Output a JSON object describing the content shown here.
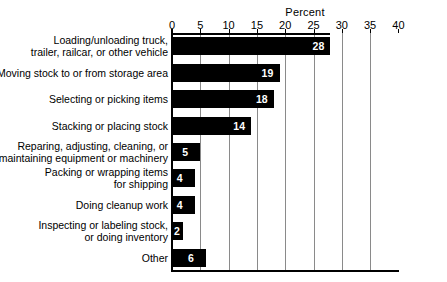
{
  "chart_data": {
    "type": "bar",
    "orientation": "horizontal",
    "title": "",
    "xlabel": "Percent",
    "ylabel": "",
    "xlim": [
      0,
      40
    ],
    "xticks": [
      0,
      5,
      10,
      15,
      20,
      25,
      30,
      35,
      40
    ],
    "xticklabels": [
      "0",
      "5",
      "10",
      "15",
      "20",
      "25",
      "30",
      "35",
      "40"
    ],
    "gridlines": [
      5,
      10,
      15,
      20,
      25,
      30,
      35
    ],
    "grid": true,
    "legend": false,
    "bar_color": "#000000",
    "value_label_color": "#ffffff",
    "categories": [
      "Loading/unloading truck, trailer, railcar, or other vehicle",
      "Moving stock to or from storage area",
      "Selecting or picking items",
      "Stacking or placing stock",
      "Reparing, adjusting, cleaning, or maintaining equipment or machinery",
      "Packing or wrapping items for shipping",
      "Doing cleanup work",
      "Inspecting or labeling stock, or doing inventory",
      "Other"
    ],
    "category_lines": [
      [
        "Loading/unloading truck,",
        "trailer, railcar, or other vehicle"
      ],
      [
        "Moving stock to or from storage area"
      ],
      [
        "Selecting or picking items"
      ],
      [
        "Stacking or placing stock"
      ],
      [
        "Reparing, adjusting, cleaning, or",
        "maintaining equipment or machinery"
      ],
      [
        "Packing or wrapping items",
        "for shipping"
      ],
      [
        "Doing cleanup work"
      ],
      [
        "Inspecting or labeling stock,",
        "or doing inventory"
      ],
      [
        "Other"
      ]
    ],
    "values": [
      28,
      19,
      18,
      14,
      5,
      4,
      4,
      2,
      6
    ],
    "value_labels": [
      "28",
      "19",
      "18",
      "14",
      "5",
      "4",
      "4",
      "2",
      "6"
    ]
  }
}
